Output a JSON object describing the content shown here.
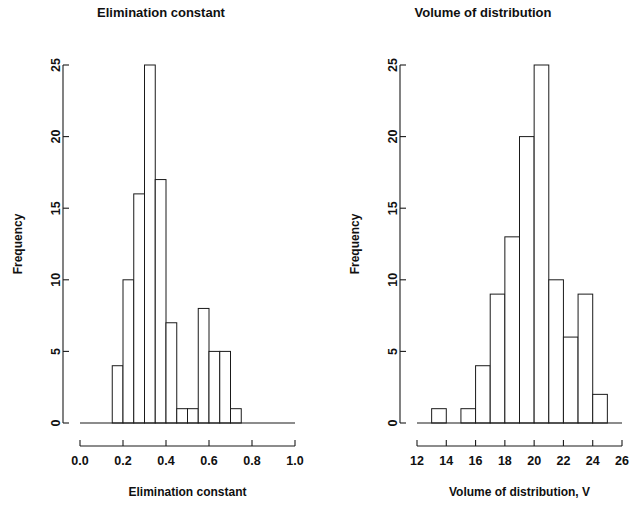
{
  "figure": {
    "width": 644,
    "height": 506,
    "background": "#ffffff",
    "foreground": "#1a1a1a",
    "panels": 2
  },
  "chart_data": [
    {
      "type": "bar",
      "subtype": "histogram",
      "panel": "left",
      "title": "Elimination constant",
      "xlabel": "Elimination constant",
      "ylabel": "Frequency",
      "xlim": [
        0.0,
        1.0
      ],
      "ylim": [
        0,
        25
      ],
      "xticks": [
        0.0,
        0.2,
        0.4,
        0.6,
        0.8,
        1.0
      ],
      "xticklabels": [
        "0.0",
        "0.2",
        "0.4",
        "0.6",
        "0.8",
        "1.0"
      ],
      "yticks": [
        0,
        5,
        10,
        15,
        20,
        25
      ],
      "yticklabels": [
        "0",
        "5",
        "10",
        "15",
        "20",
        "25"
      ],
      "grid": false,
      "legend": null,
      "bin_width": 0.05,
      "bin_edges": [
        0.15,
        0.2,
        0.25,
        0.3,
        0.35,
        0.4,
        0.45,
        0.5,
        0.55,
        0.6,
        0.65,
        0.7,
        0.75
      ],
      "categories": [
        "0.15-0.20",
        "0.20-0.25",
        "0.25-0.30",
        "0.30-0.35",
        "0.35-0.40",
        "0.40-0.45",
        "0.45-0.50",
        "0.50-0.55",
        "0.55-0.60",
        "0.60-0.65",
        "0.65-0.70",
        "0.70-0.75"
      ],
      "values": [
        4,
        10,
        16,
        25,
        17,
        7,
        1,
        1,
        8,
        5,
        5,
        1
      ]
    },
    {
      "type": "bar",
      "subtype": "histogram",
      "panel": "right",
      "title": "Volume of distribution",
      "xlabel": "Volume of distribution, V",
      "ylabel": "Frequency",
      "xlim": [
        12,
        26
      ],
      "ylim": [
        0,
        25
      ],
      "xticks": [
        12,
        14,
        16,
        18,
        20,
        22,
        24,
        26
      ],
      "xticklabels": [
        "12",
        "14",
        "16",
        "18",
        "20",
        "22",
        "24",
        "26"
      ],
      "yticks": [
        0,
        5,
        10,
        15,
        20,
        25
      ],
      "yticklabels": [
        "0",
        "5",
        "10",
        "15",
        "20",
        "25"
      ],
      "grid": false,
      "legend": null,
      "bin_width": 1,
      "bin_edges": [
        13,
        14,
        15,
        16,
        17,
        18,
        19,
        20,
        21,
        22,
        23,
        24,
        25
      ],
      "categories": [
        "13-14",
        "14-15",
        "15-16",
        "16-17",
        "17-18",
        "18-19",
        "19-20",
        "20-21",
        "21-22",
        "22-23",
        "23-24",
        "24-25"
      ],
      "values": [
        1,
        0,
        1,
        4,
        9,
        13,
        20,
        25,
        10,
        6,
        9,
        2
      ]
    }
  ]
}
